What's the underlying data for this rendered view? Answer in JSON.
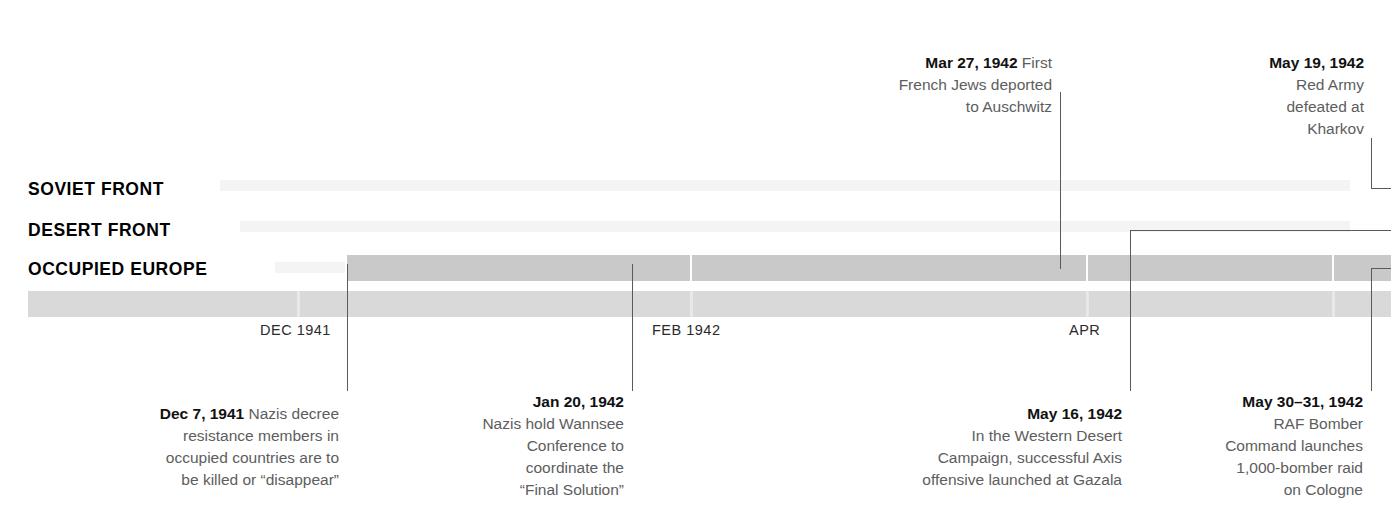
{
  "figure": {
    "type": "timeline",
    "title": "",
    "background_color": "#ffffff",
    "band_color": "#c9c9c9",
    "band_color_light": "#dcdcdc",
    "axis_band_color": "#d9d9d9",
    "leader_color": "#5a5a5a",
    "date_text_color": "#111111",
    "body_text_color": "#5d5d5d"
  },
  "rows": [
    {
      "id": "soviet-front",
      "label": "SOVIET FRONT"
    },
    {
      "id": "desert-front",
      "label": "DESERT FRONT"
    },
    {
      "id": "occupied-europe",
      "label": "OCCUPIED EUROPE"
    }
  ],
  "axis": {
    "ticks": [
      {
        "id": "dec-1941",
        "label": "DEC 1941"
      },
      {
        "id": "feb-1942",
        "label": "FEB 1942"
      },
      {
        "id": "apr-1942",
        "label": "APR"
      }
    ]
  },
  "annotations_top": [
    {
      "id": "mar-27-1942",
      "date": "Mar 27, 1942",
      "text": " First\nFrench Jews deported\nto Auschwitz",
      "align": "right",
      "row": "occupied-europe"
    },
    {
      "id": "may-19-1942",
      "date": "May 19, 1942",
      "text": "\nRed Army\ndefeated at\nKharkov",
      "align": "right",
      "row": "soviet-front"
    }
  ],
  "annotations_bottom": [
    {
      "id": "dec-7-1941",
      "date": "Dec 7, 1941",
      "text": " Nazis decree\nresistance members in\noccupied countries are to\nbe killed or “disappear”",
      "align": "right",
      "row": "occupied-europe"
    },
    {
      "id": "jan-20-1942",
      "date": "Jan 20, 1942",
      "text": "\nNazis hold Wannsee\nConference to\ncoordinate the\n“Final Solution”",
      "align": "right",
      "row": "occupied-europe"
    },
    {
      "id": "may-16-1942",
      "date": "May 16, 1942",
      "text": "\nIn the Western Desert\nCampaign, successful Axis\noffensive launched at Gazala",
      "align": "right",
      "row": "desert-front"
    },
    {
      "id": "may-30-31-1942",
      "date": "May 30–31, 1942",
      "text": "\nRAF Bomber\nCommand launches\n1,000-bomber raid\non Cologne",
      "align": "right",
      "row": "occupied-europe"
    }
  ]
}
